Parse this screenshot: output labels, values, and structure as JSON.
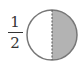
{
  "fraction": {
    "numerator": "1",
    "denominator": "2"
  },
  "circle": {
    "cx": 52,
    "cy": 35,
    "r": 25,
    "shaded_part": "right-half",
    "shade_color": "#b3b3b3",
    "stroke_color": "#777777",
    "divider": "dashed-vertical"
  }
}
